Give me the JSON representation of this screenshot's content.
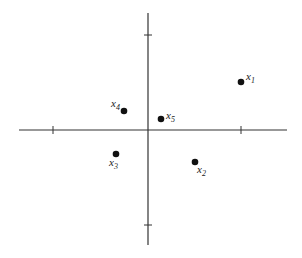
{
  "figure": {
    "axes": {
      "x_axis": {
        "x1": 19,
        "x2": 287,
        "y": 130,
        "ticks": [
          53,
          241
        ]
      },
      "y_axis": {
        "x": 148,
        "y1": 13,
        "y2": 245,
        "ticks": [
          35,
          225
        ]
      },
      "color": "#333333"
    },
    "points": [
      {
        "id": "x1",
        "base": "x",
        "sub": "1",
        "cx": 241,
        "cy": 82,
        "lx": 246,
        "ly": 80
      },
      {
        "id": "x2",
        "base": "x",
        "sub": "2",
        "cx": 195,
        "cy": 162,
        "lx": 197,
        "ly": 173
      },
      {
        "id": "x3",
        "base": "x",
        "sub": "3",
        "cx": 116,
        "cy": 154,
        "lx": 109,
        "ly": 166
      },
      {
        "id": "x4",
        "base": "x",
        "sub": "4",
        "cx": 124,
        "cy": 111,
        "lx": 111,
        "ly": 107
      },
      {
        "id": "x5",
        "base": "x",
        "sub": "5",
        "cx": 161,
        "cy": 119,
        "lx": 166,
        "ly": 119
      }
    ]
  }
}
